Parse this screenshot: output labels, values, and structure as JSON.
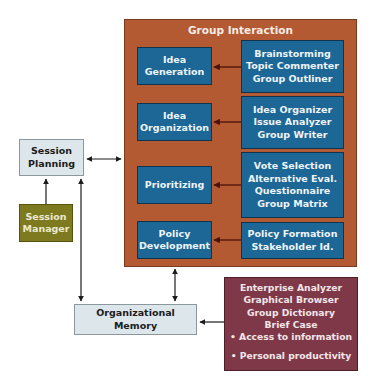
{
  "diagram": {
    "group_interaction": {
      "title": "Group Interaction",
      "stages": [
        {
          "label_lines": [
            "Idea",
            "Generation"
          ],
          "tools": [
            "Brainstorming",
            "Topic Commenter",
            "Group Outliner"
          ]
        },
        {
          "label_lines": [
            "Idea",
            "Organization"
          ],
          "tools": [
            "Idea Organizer",
            "Issue Analyzer",
            "Group Writer"
          ]
        },
        {
          "label_lines": [
            "Prioritizing"
          ],
          "tools": [
            "Vote Selection",
            "Alternative Eval.",
            "Questionnaire",
            "Group Matrix"
          ]
        },
        {
          "label_lines": [
            "Policy",
            "Development"
          ],
          "tools": [
            "Policy Formation",
            "Stakeholder Id."
          ]
        }
      ]
    },
    "session_planning": {
      "label_lines": [
        "Session",
        "Planning"
      ]
    },
    "session_manager": {
      "label_lines": [
        "Session",
        "Manager"
      ]
    },
    "organizational_memory": {
      "label": "Organizational Memory"
    },
    "memory_tools": {
      "tools": [
        "Enterprise Analyzer",
        "Graphical Browser",
        "Group Dictionary",
        "Brief Case"
      ],
      "bullets": [
        "• Access to information",
        "• Personal productivity"
      ]
    },
    "colors": {
      "group_panel": "#b35a33",
      "stage_box": "#1d6796",
      "light_box": "#dde6ea",
      "manager_box": "#7d7a1f",
      "memory_tools_box": "#7f3848",
      "arrow": "#1b1b1b",
      "inner_arrow": "#5a1a10"
    }
  }
}
